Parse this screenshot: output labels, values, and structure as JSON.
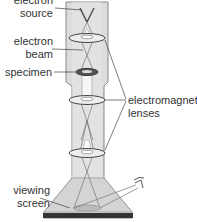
{
  "labels": {
    "source_l1": "electron",
    "source_l2": "source",
    "beam_l1": "electron",
    "beam_l2": "beam",
    "specimen": "specimen",
    "lenses_l1": "electromagnetic",
    "lenses_l2": "lenses",
    "screen_l1": "viewing",
    "screen_l2": "screen"
  },
  "colors": {
    "column_fill": "#dcdcdc",
    "column_stroke": "#8a8a8a",
    "beam_fill": "#f4f4f4",
    "lens_fill": "#eeeeee",
    "specimen_ring": "#555555",
    "base_bar": "#333333",
    "text": "#333333"
  }
}
